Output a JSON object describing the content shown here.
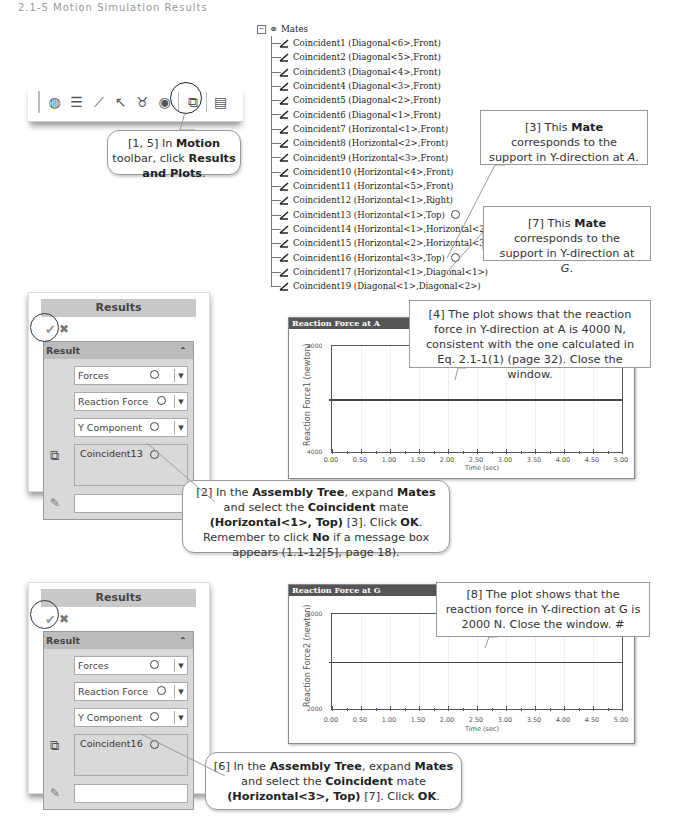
{
  "header": {
    "text": "2.1-5 Motion Simulation Results"
  },
  "toolbar": {
    "icons": [
      "motion-study-icon",
      "stack-icon",
      "spring-icon",
      "force-arrow-icon",
      "motor-icon",
      "gravity-icon",
      "results-and-plots-icon",
      "properties-icon"
    ]
  },
  "callouts": {
    "c1": {
      "pre": "[1, 5] In ",
      "b1": "Motion",
      "mid": " toolbar, click ",
      "b2": "Results and Plots",
      "post": "."
    },
    "c3": {
      "pre": "[3] This ",
      "b1": "Mate",
      "post": " corresponds to the support in Y-direction at ",
      "it": "A",
      "end": "."
    },
    "c7": {
      "pre": "[7] This ",
      "b1": "Mate",
      "post": " corresponds to the support in Y-direction at ",
      "it": "G",
      "end": "."
    },
    "c4": {
      "text": "[4] The plot shows that the reaction force in Y-direction at A is 4000 N, consistent with the one calculated in Eq. 2.1-1(1) (page 32). Close the window."
    },
    "c2": {
      "p1": "[2] In the ",
      "b1": "Assembly Tree",
      "p2": ", expand ",
      "b2": "Mates",
      "p3": " and select the ",
      "b3": "Coincident",
      "p4": " mate ",
      "b4": "(Horizontal<1>, Top)",
      "p5": " [3]. Click ",
      "b5": "OK",
      "p6": ". Remember to click ",
      "b6": "No",
      "p7": " if a message box appears (1.1-12[5], page 18)."
    },
    "c8": {
      "text": "[8] The plot shows that the reaction force in Y-direction at G is 2000 N. Close the window. #"
    },
    "c6": {
      "p1": "[6] In the ",
      "b1": "Assembly Tree",
      "p2": ", expand ",
      "b2": "Mates",
      "p3": " and select the ",
      "b3": "Coincident",
      "p4": " mate ",
      "b4": "(Horizontal<3>, Top)",
      "p5": " [7]. Click ",
      "b5": "OK",
      "p6": "."
    }
  },
  "tree": {
    "root": "Mates",
    "items": [
      {
        "label": "Coincident1 (Diagonal<6>,Front)"
      },
      {
        "label": "Coincident2 (Diagonal<5>,Front)"
      },
      {
        "label": "Coincident3 (Diagonal<4>,Front)"
      },
      {
        "label": "Coincident4 (Diagonal<3>,Front)"
      },
      {
        "label": "Coincident5 (Diagonal<2>,Front)"
      },
      {
        "label": "Coincident6 (Diagonal<1>,Front)"
      },
      {
        "label": "Coincident7 (Horizontal<1>,Front)"
      },
      {
        "label": "Coincident8 (Horizontal<2>,Front)"
      },
      {
        "label": "Coincident9 (Horizontal<3>,Front)"
      },
      {
        "label": "Coincident10 (Horizontal<4>,Front)"
      },
      {
        "label": "Coincident11 (Horizontal<5>,Front)"
      },
      {
        "label": "Coincident12 (Horizontal<1>,Right)"
      },
      {
        "label": "Coincident13 (Horizontal<1>,Top)"
      },
      {
        "label": "Coincident14 (Horizontal<1>,Horizontal<2>)"
      },
      {
        "label": "Coincident15 (Horizontal<2>,Horizontal<3>)"
      },
      {
        "label": "Coincident16 (Horizontal<3>,Top)"
      },
      {
        "label": "Coincident17 (Horizontal<1>,Diagonal<1>)"
      },
      {
        "label": "Coincident19 (Diagonal<1>,Diagonal<2>)"
      }
    ]
  },
  "panels": [
    {
      "title": "Results",
      "ok": "✔",
      "cancel": "✖",
      "section": "Result",
      "collapse": "⌃",
      "category": "Forces",
      "subcategory": "Reaction Force",
      "component": "Y Component",
      "selection": "Coincident13"
    },
    {
      "title": "Results",
      "ok": "✔",
      "cancel": "✖",
      "section": "Result",
      "collapse": "⌃",
      "category": "Forces",
      "subcategory": "Reaction Force",
      "component": "Y Component",
      "selection": "Coincident16"
    }
  ],
  "charts": [
    {
      "title": "Reaction Force at A",
      "ylabel": "Reaction Force1 (newton)",
      "ytop": "4000",
      "ybottom": "4000",
      "xlabel": "Time (sec)",
      "xticks": [
        "0.00",
        "0.50",
        "1.00",
        "1.50",
        "2.00",
        "2.50",
        "3.00",
        "3.50",
        "4.00",
        "4.50",
        "5.00"
      ]
    },
    {
      "title": "Reaction Force at G",
      "ylabel": "Reaction Force2 (newton)",
      "ytop": "2000",
      "ybottom": "2000",
      "xlabel": "Time (sec)",
      "xticks": [
        "0.00",
        "0.50",
        "1.00",
        "1.50",
        "2.00",
        "2.50",
        "3.00",
        "3.50",
        "4.00",
        "4.50",
        "5.00"
      ]
    }
  ],
  "chart_data": [
    {
      "type": "line",
      "title": "Reaction Force at A",
      "xlabel": "Time (sec)",
      "ylabel": "Reaction Force1 (newton)",
      "x": [
        0.0,
        0.5,
        1.0,
        1.5,
        2.0,
        2.5,
        3.0,
        3.5,
        4.0,
        4.5,
        5.0
      ],
      "series": [
        {
          "name": "Reaction Force1",
          "values": [
            4000,
            4000,
            4000,
            4000,
            4000,
            4000,
            4000,
            4000,
            4000,
            4000,
            4000
          ]
        }
      ],
      "xlim": [
        0,
        5
      ],
      "ytick_labels": [
        "4000",
        "4000"
      ],
      "grid": true
    },
    {
      "type": "line",
      "title": "Reaction Force at G",
      "xlabel": "Time (sec)",
      "ylabel": "Reaction Force2 (newton)",
      "x": [
        0.0,
        0.5,
        1.0,
        1.5,
        2.0,
        2.5,
        3.0,
        3.5,
        4.0,
        4.5,
        5.0
      ],
      "series": [
        {
          "name": "Reaction Force2",
          "values": [
            2000,
            2000,
            2000,
            2000,
            2000,
            2000,
            2000,
            2000,
            2000,
            2000,
            2000
          ]
        }
      ],
      "xlim": [
        0,
        5
      ],
      "ytick_labels": [
        "2000",
        "2000"
      ],
      "grid": true
    }
  ]
}
